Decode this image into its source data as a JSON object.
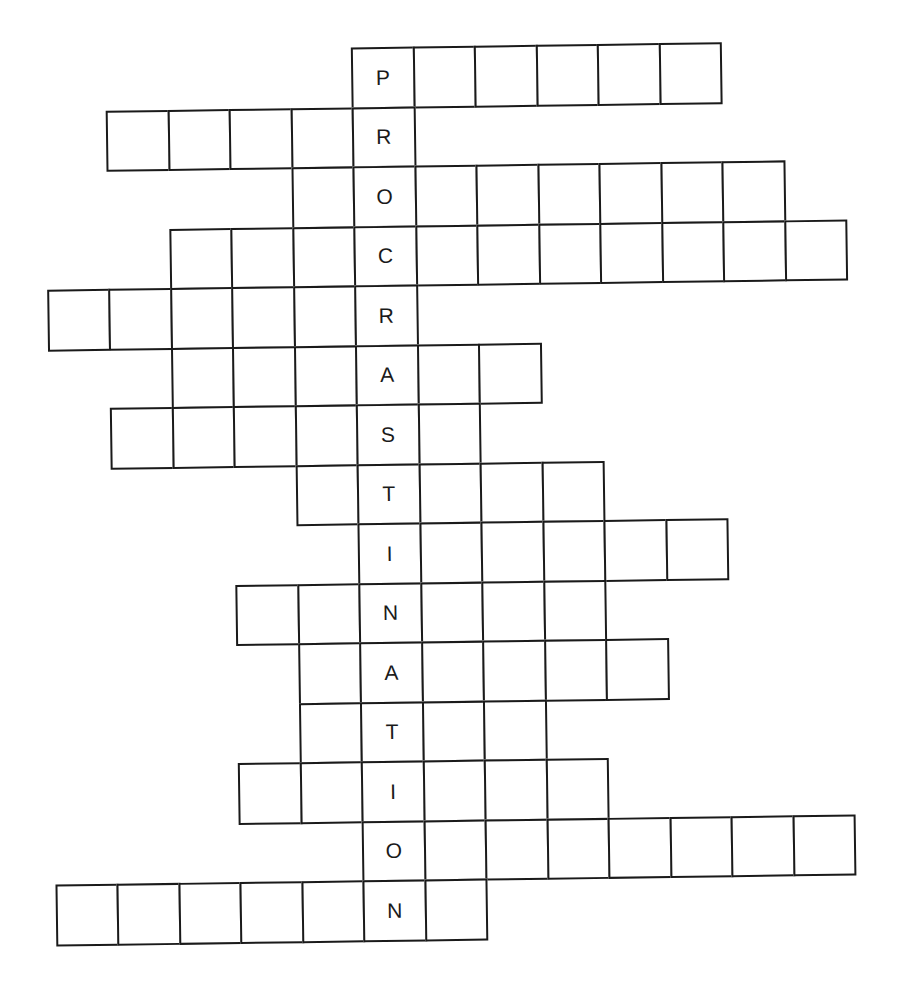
{
  "puzzle": {
    "type": "crossword",
    "key_word": "PROCRASTINATION",
    "cell_width": 61.5,
    "cell_height": 59.5,
    "origin_x": 358,
    "origin_y": 47,
    "rows": [
      {
        "letter": "P",
        "start": 0,
        "end": 5
      },
      {
        "letter": "R",
        "start": -4,
        "end": 0
      },
      {
        "letter": "O",
        "start": -1,
        "end": 6
      },
      {
        "letter": "C",
        "start": -3,
        "end": 7
      },
      {
        "letter": "R",
        "start": -5,
        "end": 0
      },
      {
        "letter": "A",
        "start": -3,
        "end": 2
      },
      {
        "letter": "S",
        "start": -4,
        "end": 1
      },
      {
        "letter": "T",
        "start": -1,
        "end": 3
      },
      {
        "letter": "I",
        "start": 0,
        "end": 5
      },
      {
        "letter": "N",
        "start": -2,
        "end": 3
      },
      {
        "letter": "A",
        "start": -1,
        "end": 4
      },
      {
        "letter": "T",
        "start": -1,
        "end": 2
      },
      {
        "letter": "I",
        "start": -2,
        "end": 3
      },
      {
        "letter": "O",
        "start": 0,
        "end": 7
      },
      {
        "letter": "N",
        "start": -5,
        "end": 1
      }
    ]
  }
}
